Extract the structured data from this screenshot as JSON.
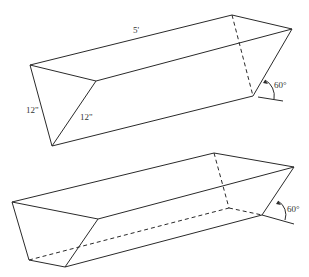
{
  "figures": [
    {
      "name": "triangular-trough",
      "labels": {
        "length": "5'",
        "side_left": "12\"",
        "side_right": "12\"",
        "angle": "60°"
      }
    },
    {
      "name": "trapezoidal-trough",
      "labels": {
        "angle": "60°"
      }
    }
  ],
  "colors": {
    "stroke": "#2a2a2a",
    "background": "#ffffff"
  }
}
